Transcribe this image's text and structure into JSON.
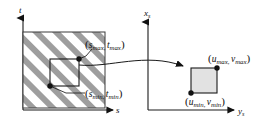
{
  "figure": {
    "background_color": "#ffffff",
    "ink_color": "#111111",
    "hatch_color": "#9e9e9e",
    "fill_color": "#e2e2e2"
  },
  "left_panel": {
    "name": "texture-space",
    "axes": {
      "vertical_label": "t",
      "vertical_sub": "",
      "horizontal_label": "s",
      "horizontal_sub": ""
    },
    "domain_box": {
      "description": "hatched square region",
      "hatch_angle_deg": 45
    },
    "selection_rect": {
      "max_corner_label": {
        "open": "(",
        "first_var": "s",
        "first_sub": "max",
        "comma": ",",
        "second_var": "t",
        "second_sub": "max",
        "close": ")"
      },
      "min_corner_label": {
        "open": "(",
        "first_var": "s",
        "first_sub": "min",
        "comma": ",",
        "second_var": "t",
        "second_sub": "min",
        "close": ")"
      }
    }
  },
  "right_panel": {
    "name": "screen-space",
    "axes": {
      "vertical_label": "x",
      "vertical_sub": "s",
      "horizontal_label": "y",
      "horizontal_sub": "s"
    },
    "mapped_rect": {
      "max_corner_label": {
        "open": "(",
        "first_var": "u",
        "first_sub": "max",
        "comma": ",",
        "second_var": "v",
        "second_sub": "max",
        "close": ")"
      },
      "min_corner_label": {
        "open": "(",
        "first_var": "u",
        "first_sub": "min",
        "comma": ",",
        "second_var": "v",
        "second_sub": "min",
        "close": ")"
      }
    }
  },
  "mapping_arrow": {
    "name": "transform-arrow",
    "direction": "left-to-right"
  }
}
